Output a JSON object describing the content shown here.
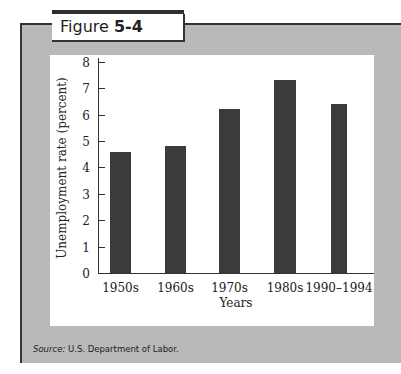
{
  "figure": {
    "label_prefix": "Figure ",
    "label_number": "5-4",
    "source_label": "Source:",
    "source_text": " U.S. Department of Labor."
  },
  "chart_data": {
    "type": "bar",
    "title": "Figure 5-4",
    "categories": [
      "1950s",
      "1960s",
      "1970s",
      "1980s",
      "1990–1994"
    ],
    "values": [
      4.6,
      4.8,
      6.2,
      7.3,
      6.4
    ],
    "xlabel": "Years",
    "ylabel": "Unemployment rate (percent)",
    "ylim": [
      0,
      8
    ],
    "yticks": [
      "0",
      "1",
      "2",
      "3",
      "4",
      "5",
      "6",
      "7",
      "8"
    ],
    "grid": false,
    "legend": null,
    "bar_color": "#3b3b3b",
    "source": "Source: U.S. Department of Labor."
  }
}
